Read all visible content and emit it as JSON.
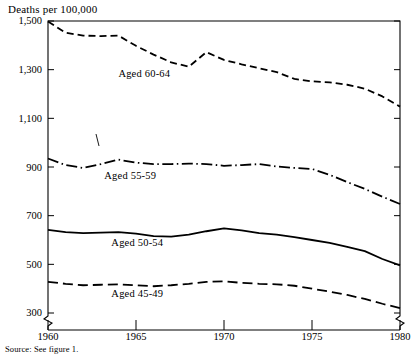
{
  "figure": {
    "axis_title": "Deaths per 100,000",
    "source_note": "Source:  See figure 1."
  },
  "chart_data": {
    "type": "line",
    "title": "Deaths per 100,000",
    "xlabel": "",
    "ylabel": "Deaths per 100,000",
    "xlim": [
      1960,
      1980
    ],
    "ylim": [
      300,
      1500
    ],
    "xticks": [
      1960,
      1965,
      1970,
      1975,
      1980
    ],
    "xtick_labels": [
      "1960",
      "1965",
      "1970",
      "1975",
      "1980"
    ],
    "yticks": [
      300,
      500,
      700,
      900,
      1100,
      1300,
      1500
    ],
    "ytick_labels": [
      "300",
      "500",
      "700",
      "900",
      "1,100",
      "1,300",
      "1,500"
    ],
    "grid": false,
    "legend": "inline-labels",
    "axis_break": "y-axis truncated below 300; zigzag breaks at both lower corners",
    "x": [
      1960,
      1961,
      1962,
      1963,
      1964,
      1965,
      1966,
      1967,
      1968,
      1969,
      1970,
      1971,
      1972,
      1973,
      1974,
      1975,
      1976,
      1977,
      1978,
      1979,
      1980
    ],
    "series": [
      {
        "name": "Aged 60-64",
        "label": "Aged 60-64",
        "style": "dashed",
        "color": "#000000",
        "values": [
          1498,
          1452,
          1440,
          1438,
          1440,
          1398,
          1362,
          1330,
          1312,
          1372,
          1340,
          1322,
          1306,
          1290,
          1262,
          1252,
          1248,
          1238,
          1222,
          1190,
          1148
        ]
      },
      {
        "name": "Aged 55-59",
        "label": "Aged 55-59",
        "style": "dash-dot",
        "color": "#000000",
        "values": [
          935,
          908,
          896,
          912,
          930,
          918,
          912,
          912,
          914,
          912,
          905,
          908,
          912,
          902,
          896,
          892,
          868,
          838,
          810,
          778,
          748
        ]
      },
      {
        "name": "Aged 50-54",
        "label": "Aged 50-54",
        "style": "solid",
        "color": "#000000",
        "values": [
          642,
          632,
          628,
          630,
          632,
          626,
          616,
          614,
          622,
          636,
          648,
          640,
          628,
          622,
          612,
          600,
          588,
          572,
          554,
          522,
          496
        ]
      },
      {
        "name": "Aged 45-49",
        "label": "Aged 45-49",
        "style": "long-dash",
        "color": "#000000",
        "values": [
          428,
          420,
          414,
          416,
          418,
          414,
          410,
          414,
          420,
          428,
          430,
          424,
          420,
          418,
          412,
          400,
          388,
          374,
          358,
          338,
          320
        ]
      }
    ],
    "series_label_positions": [
      {
        "label": "Aged 60-64",
        "x": 1964.0,
        "y": 1282
      },
      {
        "label": "Aged 55-59",
        "x": 1963.2,
        "y": 862
      },
      {
        "label": "Aged 50-54",
        "x": 1963.6,
        "y": 588
      },
      {
        "label": "Aged 45-49",
        "x": 1963.6,
        "y": 378
      }
    ]
  }
}
